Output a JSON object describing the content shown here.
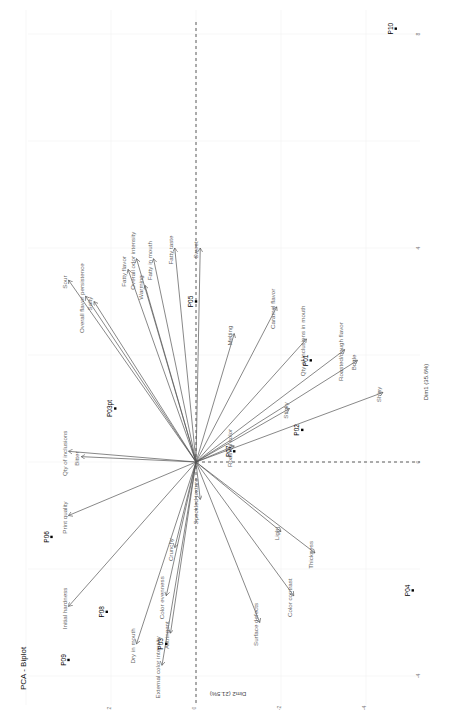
{
  "chart_data": {
    "type": "scatter",
    "subtype": "pca-biplot",
    "title": "PCA - Biplot",
    "xlabel": "Dim1 (35.6%)",
    "ylabel": "Dim2 (21.5%)",
    "orientation_note": "rendered rotated 90deg; Dim1 runs bottom-to-top, Dim2 runs right-to-left",
    "xlim": [
      -4.5,
      8.5
    ],
    "ylim": [
      -5,
      4.5
    ],
    "x_ticks": [
      -4,
      0,
      4,
      8
    ],
    "y_ticks": [
      -4,
      -2,
      0,
      2
    ],
    "grid": true,
    "individuals": [
      {
        "name": "P10",
        "x": 8.1,
        "y": -4.7
      },
      {
        "name": "P05",
        "x": 3.0,
        "y": 0.0
      },
      {
        "name": "P01",
        "x": 1.9,
        "y": -2.7
      },
      {
        "name": "P02",
        "x": 0.6,
        "y": -2.5
      },
      {
        "name": "P07",
        "x": 0.2,
        "y": -0.9
      },
      {
        "name": "P03opt",
        "label": "P03pt",
        "x": 1.0,
        "y": 1.9
      },
      {
        "name": "P06",
        "x": -1.4,
        "y": 3.4
      },
      {
        "name": "P08",
        "x": -2.8,
        "y": 2.1
      },
      {
        "name": "P09",
        "x": -3.7,
        "y": 3.0
      },
      {
        "name": "P03",
        "x": -3.4,
        "y": 0.7
      },
      {
        "name": "P04",
        "x": -2.4,
        "y": -5.1
      }
    ],
    "variables": [
      {
        "name": "Fatty taste",
        "x": 4.0,
        "y": 0.5
      },
      {
        "name": "Sweet",
        "x": 4.0,
        "y": -0.1
      },
      {
        "name": "Caramel flavor",
        "x": 2.9,
        "y": -1.9
      },
      {
        "name": "Melting",
        "x": 2.4,
        "y": -0.9
      },
      {
        "name": "Qty of inclusions in mouth",
        "x": 2.3,
        "y": -2.6
      },
      {
        "name": "Overall flavor persistence",
        "x": 3.1,
        "y": 2.6
      },
      {
        "name": "Sour",
        "x": 3.4,
        "y": 3.0
      },
      {
        "name": "Salty",
        "x": 3.0,
        "y": 2.4
      },
      {
        "name": "Fatty flavor",
        "x": 3.6,
        "y": 1.6
      },
      {
        "name": "Overall odor intensity",
        "x": 3.8,
        "y": 1.4
      },
      {
        "name": "Fatty in mouth",
        "x": 3.8,
        "y": 1.0
      },
      {
        "name": "Warming",
        "x": 3.3,
        "y": 1.2
      },
      {
        "name": "Roasted/dough flavor",
        "x": 2.1,
        "y": -3.5
      },
      {
        "name": "Brittle",
        "x": 1.9,
        "y": -3.8
      },
      {
        "name": "Sticky",
        "x": 1.0,
        "y": -2.2
      },
      {
        "name": "Shiny",
        "x": 1.3,
        "y": -4.4
      },
      {
        "name": "Roasted color",
        "x": 0.3,
        "y": -0.9
      },
      {
        "name": "Qty of inclusions",
        "x": 0.2,
        "y": 3.0
      },
      {
        "name": "Bitter",
        "x": 0.1,
        "y": 2.7
      },
      {
        "name": "Print quality",
        "x": -1.0,
        "y": 3.0
      },
      {
        "name": "Initial hardness",
        "x": -2.7,
        "y": 3.0
      },
      {
        "name": "Dry in mouth",
        "x": -3.4,
        "y": 1.4
      },
      {
        "name": "External color intensity",
        "x": -3.8,
        "y": 0.8
      },
      {
        "name": "Astringent",
        "x": -3.2,
        "y": 0.6
      },
      {
        "name": "Color evenness",
        "x": -2.5,
        "y": 0.7
      },
      {
        "name": "Crunchy",
        "x": -1.6,
        "y": 0.5
      },
      {
        "name": "Speckled texture",
        "x": -0.7,
        "y": -0.1
      },
      {
        "name": "Light",
        "x": -1.3,
        "y": -2.0
      },
      {
        "name": "Thickness",
        "x": -1.7,
        "y": -2.8
      },
      {
        "name": "Color contrast",
        "x": -2.5,
        "y": -2.3
      },
      {
        "name": "Surface defects",
        "x": -3.0,
        "y": -1.5
      }
    ]
  },
  "labels": {
    "title": "PCA - Biplot",
    "dim1": "Dim1 (35.6%)",
    "dim2": "Dim2 (21.5%)"
  },
  "colors": {
    "arrow": "#555555",
    "variable_label": "#666666",
    "individual": "#000000",
    "zero_line": "#333333",
    "grid": "#f2f2f2"
  }
}
